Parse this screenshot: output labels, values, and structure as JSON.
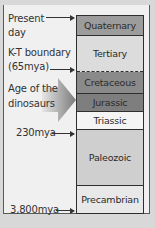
{
  "diagram": {
    "title_partial": "",
    "labels": {
      "present_day_line1": "Present",
      "present_day_line2": "day",
      "kt_line1": "K-T boundary",
      "kt_line2": "(65mya)",
      "dino_line1": "Age of the",
      "dino_line2": "dinosaurs",
      "mya_230": "230mya",
      "mya_3800": "3,800mya"
    },
    "layers": [
      {
        "name": "Quaternary",
        "color": "#9c9c9c"
      },
      {
        "name": "Tertiary",
        "color": "#dcdcdc"
      },
      {
        "name": "Cretaceous",
        "color": "#8a8a8a"
      },
      {
        "name": "Jurassic",
        "color": "#7e7e7e"
      },
      {
        "name": "Triassic",
        "color": "#f4f4f4"
      },
      {
        "name": "Paleozoic",
        "color": "#cfcfcf"
      },
      {
        "name": "Precambrian",
        "color": "#e8e8e8"
      }
    ]
  }
}
